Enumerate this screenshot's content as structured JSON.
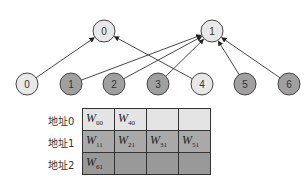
{
  "colors": {
    "light_node": "#e8e8e8",
    "dark_node": "#a0a0a0",
    "stroke": "#444444",
    "row0": "#e4e4e4",
    "row1": "#a9a9a9",
    "row2": "#999999"
  },
  "top_nodes": [
    {
      "id": "0",
      "label": "0",
      "x": 104,
      "y": 31
    },
    {
      "id": "1",
      "label": "1",
      "x": 212,
      "y": 31
    }
  ],
  "bottom_nodes": [
    {
      "id": "0",
      "label": "0",
      "x": 27,
      "y": 84,
      "shade": "light"
    },
    {
      "id": "1",
      "label": "1",
      "x": 71,
      "y": 84,
      "shade": "dark"
    },
    {
      "id": "2",
      "label": "2",
      "x": 114,
      "y": 84,
      "shade": "dark"
    },
    {
      "id": "3",
      "label": "3",
      "x": 158,
      "y": 84,
      "shade": "dark"
    },
    {
      "id": "4",
      "label": "4",
      "x": 202,
      "y": 84,
      "shade": "light"
    },
    {
      "id": "5",
      "label": "5",
      "x": 245,
      "y": 84,
      "shade": "dark"
    },
    {
      "id": "6",
      "label": "6",
      "x": 289,
      "y": 84,
      "shade": "dark"
    }
  ],
  "edges": [
    {
      "from": "b0",
      "to": "t0"
    },
    {
      "from": "b4",
      "to": "t0"
    },
    {
      "from": "b1",
      "to": "t1"
    },
    {
      "from": "b2",
      "to": "t1"
    },
    {
      "from": "b3",
      "to": "t1"
    },
    {
      "from": "b5",
      "to": "t1"
    },
    {
      "from": "b6",
      "to": "t1"
    }
  ],
  "table": {
    "rows": [
      {
        "label": "地址0",
        "cells": [
          {
            "w": "W",
            "sub": "00"
          },
          {
            "w": "W",
            "sub": "40"
          },
          {
            "w": "",
            "sub": ""
          },
          {
            "w": "",
            "sub": ""
          }
        ]
      },
      {
        "label": "地址1",
        "cells": [
          {
            "w": "W",
            "sub": "11"
          },
          {
            "w": "W",
            "sub": "21"
          },
          {
            "w": "W",
            "sub": "31"
          },
          {
            "w": "W",
            "sub": "51"
          }
        ]
      },
      {
        "label": "地址2",
        "cells": [
          {
            "w": "W",
            "sub": "61"
          },
          {
            "w": "",
            "sub": ""
          },
          {
            "w": "",
            "sub": ""
          },
          {
            "w": "",
            "sub": ""
          }
        ]
      }
    ]
  }
}
